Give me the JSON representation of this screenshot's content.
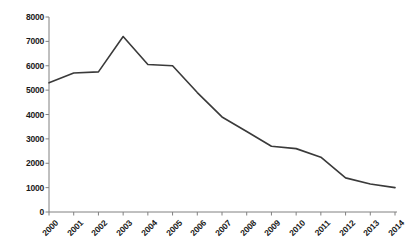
{
  "chart_data": {
    "type": "line",
    "title": "",
    "subtitle": "",
    "xlabel": "",
    "ylabel": "",
    "categories": [
      "2000",
      "2001",
      "2002",
      "2003",
      "2004",
      "2005",
      "2006",
      "2007",
      "2008",
      "2009",
      "2010",
      "2011",
      "2012",
      "2013",
      "2014"
    ],
    "values": [
      5300,
      5700,
      5750,
      7200,
      6050,
      6000,
      4900,
      3900,
      3300,
      2700,
      2600,
      2250,
      1400,
      1150,
      1000
    ],
    "series": [
      {
        "name": "",
        "values": [
          5300,
          5700,
          5750,
          7200,
          6050,
          6000,
          4900,
          3900,
          3300,
          2700,
          2600,
          2250,
          1400,
          1150,
          1000
        ]
      }
    ],
    "ylim": [
      0,
      8000
    ],
    "yticks": [
      0,
      1000,
      2000,
      3000,
      4000,
      5000,
      6000,
      7000,
      8000
    ],
    "ytick_labels": [
      "0",
      "1000",
      "2000",
      "3000",
      "4000",
      "5000",
      "6000",
      "7000",
      "8000"
    ],
    "xtick_labels": [
      "2000",
      "2001",
      "2002",
      "2003",
      "2004",
      "2005",
      "2006",
      "2007",
      "2008",
      "2009",
      "2010",
      "2011",
      "2012",
      "2013",
      "2014"
    ],
    "xtick_rotation": -45,
    "grid": false,
    "legend": false,
    "legend_position": "none",
    "markers": false,
    "line_color": "#3a3a3a",
    "line_width": 1.6,
    "axis_color": "#808080",
    "background_color": "#ffffff",
    "text_color": "#1a1a1a",
    "annotations": []
  },
  "layout": {
    "plot_left": 49,
    "plot_right": 395,
    "plot_top": 17,
    "plot_bottom": 212,
    "tick_length": 3.5
  }
}
